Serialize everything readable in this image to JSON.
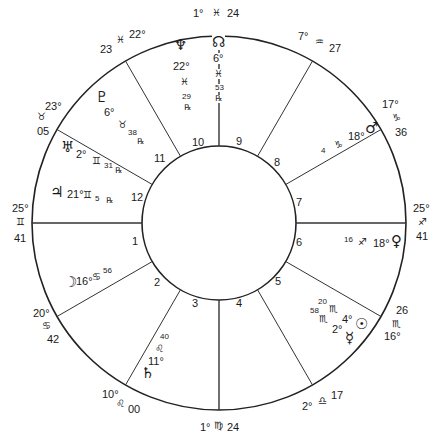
{
  "chart": {
    "center": [
      219,
      223
    ],
    "outer_radius": 187,
    "inner_radius": 77,
    "line_color": "#222222",
    "house_cusp_angles_deg": [
      180,
      210,
      240,
      270,
      300,
      330,
      0,
      30,
      60,
      90,
      120,
      150
    ]
  },
  "house_numbers": [
    {
      "n": "1",
      "x": 132,
      "y": 238
    },
    {
      "n": "2",
      "x": 154,
      "y": 278
    },
    {
      "n": "3",
      "x": 192,
      "y": 299
    },
    {
      "n": "4",
      "x": 236,
      "y": 299
    },
    {
      "n": "5",
      "x": 275,
      "y": 277
    },
    {
      "n": "6",
      "x": 296,
      "y": 238
    },
    {
      "n": "7",
      "x": 296,
      "y": 198
    },
    {
      "n": "8",
      "x": 274,
      "y": 158
    },
    {
      "n": "9",
      "x": 236,
      "y": 137
    },
    {
      "n": "10",
      "x": 192,
      "y": 138
    },
    {
      "n": "11",
      "x": 154,
      "y": 154
    },
    {
      "n": "12",
      "x": 131,
      "y": 193
    }
  ],
  "cusps": {
    "asc": {
      "house": "1",
      "deg": "25°",
      "sign": "♊",
      "min": "41"
    },
    "c2": {
      "house": "2",
      "deg": "20°",
      "sign": "♋",
      "min": "42"
    },
    "c3": {
      "house": "3",
      "deg": "10°",
      "sign": "♌",
      "min": "00"
    },
    "ic": {
      "house": "4",
      "deg": "1°",
      "sign": "♍",
      "min": "24"
    },
    "c5": {
      "house": "5",
      "deg": "2°",
      "sign": "♎",
      "min": "17"
    },
    "c6": {
      "house": "6",
      "deg": "16°",
      "sign": "♏",
      "min": "26"
    },
    "dsc": {
      "house": "7",
      "deg": "25°",
      "sign": "♐",
      "min": "41"
    },
    "c8": {
      "house": "8",
      "deg": "20°",
      "sign": "♑",
      "min": "42"
    },
    "c9": {
      "house": "9",
      "deg": "17°",
      "sign": "♑",
      "min": "36"
    },
    "mc": {
      "house": "10",
      "deg": "1°",
      "sign": "♓",
      "min": "24"
    },
    "c11": {
      "house": "11",
      "deg": "22°",
      "sign": "♓",
      "min": "23"
    },
    "c12": {
      "house": "12",
      "deg": "23°",
      "sign": "♉",
      "min": "05"
    }
  },
  "cusp_labels": {
    "mc": {
      "deg": "1°",
      "sign": "♓",
      "min": "24"
    },
    "c11": {
      "deg": "22°",
      "sign": "♓",
      "min": "23"
    },
    "c12": {
      "deg": "23°",
      "sign": "♉",
      "min": "05"
    },
    "asc": {
      "deg": "25°",
      "sign": "♊",
      "min": "41"
    },
    "c2": {
      "deg": "20°",
      "sign": "♋",
      "min": "42"
    },
    "c3": {
      "deg": "10°",
      "sign": "♌",
      "min": "00"
    },
    "ic": {
      "deg": "1°",
      "sign": "♍",
      "min": "24"
    },
    "c5": {
      "deg": "2°",
      "sign": "♎",
      "min": "17"
    },
    "c6": {
      "deg": "16°",
      "sign": "♏",
      "min": "26"
    },
    "dsc": {
      "deg": "25°",
      "sign": "♐",
      "min": "41"
    },
    "c8": {
      "deg": "17°",
      "sign": "♑",
      "min": "36"
    },
    "c9": {
      "deg": "7°",
      "sign": "♒",
      "min": "27"
    }
  },
  "planets": {
    "node": {
      "glyph": "☊",
      "deg": "6°",
      "sign": "♓",
      "min": "53",
      "retro": "℞"
    },
    "neptune": {
      "glyph": "♆",
      "deg": "22°",
      "sign": "♓",
      "min": "29",
      "retro": "℞"
    },
    "pluto": {
      "glyph": "♇",
      "deg": "6°",
      "sign": "♉",
      "min": "38",
      "retro": "℞"
    },
    "uranus": {
      "glyph": "♅",
      "deg": "2°",
      "sign": "♊",
      "min": "31",
      "retro": "℞"
    },
    "jupiter": {
      "glyph": "♃",
      "deg": "21°",
      "sign": "♊",
      "min": "5",
      "retro": "℞"
    },
    "moon": {
      "glyph": "☽",
      "deg": "16°",
      "sign": "♋",
      "min": "56"
    },
    "saturn": {
      "glyph": "♄",
      "deg": "11°",
      "sign": "♌",
      "min": "40"
    },
    "sun": {
      "glyph": "☉",
      "deg": "4°",
      "sign": "♏",
      "min": "20"
    },
    "mercury": {
      "glyph": "☿",
      "deg": "2°",
      "sign": "♏",
      "min": "58"
    },
    "venus": {
      "glyph": "♀",
      "deg": "18°",
      "sign": "♐",
      "min": "16"
    },
    "mars": {
      "glyph": "♂",
      "deg": "18°",
      "sign": "♑",
      "min": "4"
    }
  }
}
